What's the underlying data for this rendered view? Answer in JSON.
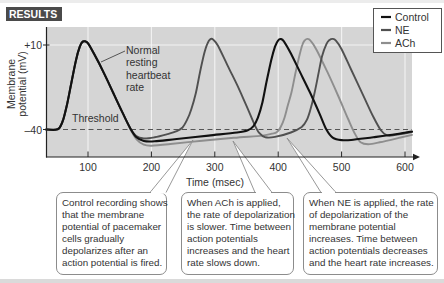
{
  "figure": {
    "results_label": "RESULTS",
    "normal_rate_label": [
      "Normal",
      "resting",
      "heartbeat",
      "rate"
    ],
    "threshold_label": "Threshold"
  },
  "legend": {
    "items": [
      {
        "label": "Control",
        "color": "#111111"
      },
      {
        "label": "NE",
        "color": "#505050"
      },
      {
        "label": "ACh",
        "color": "#8e8e8e"
      }
    ]
  },
  "callouts": [
    {
      "lines": [
        "Control recording shows",
        "that the membrane",
        "potential of pacemaker",
        "cells gradually",
        "depolarizes after an",
        "action potential is fired."
      ]
    },
    {
      "lines": [
        "When ACh is applied,",
        "the rate of depolarization",
        "is slower. Time between",
        "action potentials",
        "increases and the heart",
        "rate slows down."
      ]
    },
    {
      "lines": [
        "When NE is applied, the rate",
        "of depolarization of the",
        "membrane potential",
        "increases. Time between",
        "action potentials decreases",
        "and the heart rate increases."
      ]
    }
  ],
  "colors": {
    "plot_background": "#d5d5d5",
    "gridline": "#f3f3f3",
    "results_badge": "#4a4a4a",
    "threshold_line": "#555555",
    "callout_border": "#8c8c8c"
  },
  "chart_data": {
    "type": "line",
    "title": "RESULTS",
    "xlabel": "Time (msec)",
    "ylabel": "Membrane potential (mV)",
    "ylabel_lines": [
      "Membrane",
      "potential (mV)"
    ],
    "x_ticks": [
      100,
      200,
      300,
      400,
      500,
      600
    ],
    "x_tick_labels": [
      "100",
      "200",
      "300",
      "400",
      "500",
      "600"
    ],
    "y_ticks": [
      10,
      -40
    ],
    "y_tick_labels": [
      "+10",
      "–40"
    ],
    "xlim": [
      34,
      611
    ],
    "ylim": [
      -56,
      21
    ],
    "grid": true,
    "legend_position": "top-right",
    "threshold": {
      "label": "Threshold",
      "value": -40,
      "style": "dashed"
    },
    "annotations": [
      {
        "text": "Normal resting heartbeat rate",
        "points_to": "Control first action potential"
      }
    ],
    "series": [
      {
        "name": "Control",
        "color": "#111111",
        "points": [
          [
            34,
            -40
          ],
          [
            48,
            -40.2
          ],
          [
            55,
            -39
          ],
          [
            61,
            -34
          ],
          [
            67,
            -25
          ],
          [
            74,
            -12
          ],
          [
            81,
            1
          ],
          [
            87,
            9
          ],
          [
            91,
            11.8
          ],
          [
            95,
            12.2
          ],
          [
            100,
            11
          ],
          [
            110,
            4.5
          ],
          [
            125,
            -6.5
          ],
          [
            140,
            -18.5
          ],
          [
            155,
            -30.5
          ],
          [
            167,
            -39.5
          ],
          [
            176,
            -44.5
          ],
          [
            188,
            -46.8
          ],
          [
            205,
            -47
          ],
          [
            240,
            -45.6
          ],
          [
            290,
            -43.6
          ],
          [
            335,
            -41.8
          ],
          [
            352,
            -40.5
          ],
          [
            361,
            -38
          ],
          [
            368,
            -33
          ],
          [
            375,
            -24
          ],
          [
            382,
            -11
          ],
          [
            389,
            1
          ],
          [
            395,
            9
          ],
          [
            400,
            12.8
          ],
          [
            404,
            13.5
          ],
          [
            409,
            12.2
          ],
          [
            420,
            5
          ],
          [
            435,
            -6.5
          ],
          [
            450,
            -18
          ],
          [
            465,
            -30.5
          ],
          [
            476,
            -40
          ],
          [
            486,
            -44.8
          ],
          [
            500,
            -46.3
          ],
          [
            515,
            -46.2
          ],
          [
            550,
            -44.6
          ],
          [
            585,
            -42.8
          ],
          [
            611,
            -41.2
          ]
        ]
      },
      {
        "name": "NE",
        "color": "#505050",
        "points": [
          [
            34,
            -40
          ],
          [
            48,
            -40.2
          ],
          [
            55,
            -39
          ],
          [
            61,
            -34
          ],
          [
            67,
            -25
          ],
          [
            74,
            -12
          ],
          [
            81,
            1
          ],
          [
            87,
            9
          ],
          [
            91,
            11.8
          ],
          [
            95,
            12.2
          ],
          [
            100,
            11
          ],
          [
            110,
            4.5
          ],
          [
            125,
            -6.5
          ],
          [
            140,
            -18.5
          ],
          [
            155,
            -30.5
          ],
          [
            167,
            -39.5
          ],
          [
            176,
            -43.8
          ],
          [
            188,
            -45.3
          ],
          [
            205,
            -44.6
          ],
          [
            225,
            -42.8
          ],
          [
            240,
            -41
          ],
          [
            249,
            -38.8
          ],
          [
            256,
            -34.5
          ],
          [
            263,
            -28
          ],
          [
            270,
            -18.5
          ],
          [
            277,
            -5.5
          ],
          [
            283,
            4.5
          ],
          [
            288,
            10.5
          ],
          [
            293,
            13.5
          ],
          [
            298,
            13
          ],
          [
            305,
            9.5
          ],
          [
            320,
            -2
          ],
          [
            335,
            -13.5
          ],
          [
            350,
            -26
          ],
          [
            362,
            -36.5
          ],
          [
            370,
            -42
          ],
          [
            380,
            -44.6
          ],
          [
            395,
            -44.4
          ],
          [
            420,
            -41.8
          ],
          [
            437,
            -38.5
          ],
          [
            445,
            -34.5
          ],
          [
            451,
            -28
          ],
          [
            457,
            -19
          ],
          [
            463,
            -8
          ],
          [
            469,
            3
          ],
          [
            476,
            10.5
          ],
          [
            481,
            13
          ],
          [
            486,
            13.6
          ],
          [
            491,
            12.6
          ],
          [
            500,
            7.5
          ],
          [
            515,
            -4.5
          ],
          [
            534,
            -19.8
          ],
          [
            550,
            -32.5
          ],
          [
            562,
            -40.5
          ],
          [
            572,
            -43.5
          ],
          [
            585,
            -43.2
          ],
          [
            611,
            -41.5
          ]
        ]
      },
      {
        "name": "ACh",
        "color": "#8e8e8e",
        "points": [
          [
            34,
            -40
          ],
          [
            48,
            -40.2
          ],
          [
            55,
            -39
          ],
          [
            61,
            -34
          ],
          [
            67,
            -25
          ],
          [
            74,
            -12
          ],
          [
            81,
            1
          ],
          [
            87,
            9
          ],
          [
            91,
            11.8
          ],
          [
            95,
            12.2
          ],
          [
            100,
            11
          ],
          [
            110,
            4.5
          ],
          [
            125,
            -6.5
          ],
          [
            140,
            -18.5
          ],
          [
            155,
            -30.5
          ],
          [
            167,
            -40
          ],
          [
            177,
            -46
          ],
          [
            188,
            -49
          ],
          [
            200,
            -49.6
          ],
          [
            230,
            -48.6
          ],
          [
            280,
            -46.6
          ],
          [
            330,
            -44.9
          ],
          [
            375,
            -43.6
          ],
          [
            390,
            -42.5
          ],
          [
            398,
            -41.5
          ],
          [
            404,
            -38.5
          ],
          [
            410,
            -33
          ],
          [
            415,
            -26
          ],
          [
            421,
            -18
          ],
          [
            427,
            -7
          ],
          [
            433,
            3
          ],
          [
            438,
            10
          ],
          [
            442,
            12.8
          ],
          [
            446,
            13.6
          ],
          [
            451,
            12.6
          ],
          [
            460,
            7.5
          ],
          [
            477,
            -5.5
          ],
          [
            494,
            -19.6
          ],
          [
            510,
            -33.5
          ],
          [
            521,
            -42.5
          ],
          [
            530,
            -47.5
          ],
          [
            542,
            -48.7
          ],
          [
            560,
            -47.6
          ],
          [
            590,
            -45
          ],
          [
            611,
            -43.2
          ]
        ]
      }
    ]
  }
}
